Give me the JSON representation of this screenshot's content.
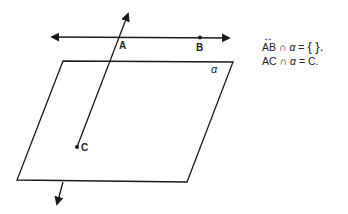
{
  "diagram": {
    "points": [
      {
        "name": "A",
        "label": "A"
      },
      {
        "name": "B",
        "label": "B"
      },
      {
        "name": "C",
        "label": "C"
      }
    ],
    "plane_label": "α",
    "equations": [
      {
        "line": "AB",
        "op": "∩",
        "plane": "α",
        "eq": "=",
        "result": "{   }."
      },
      {
        "line": "AC",
        "op": "∩",
        "plane": "α",
        "eq": "=",
        "result": "C."
      }
    ],
    "colors": {
      "stroke": "#1a1a1a",
      "background": "#ffffff"
    }
  }
}
